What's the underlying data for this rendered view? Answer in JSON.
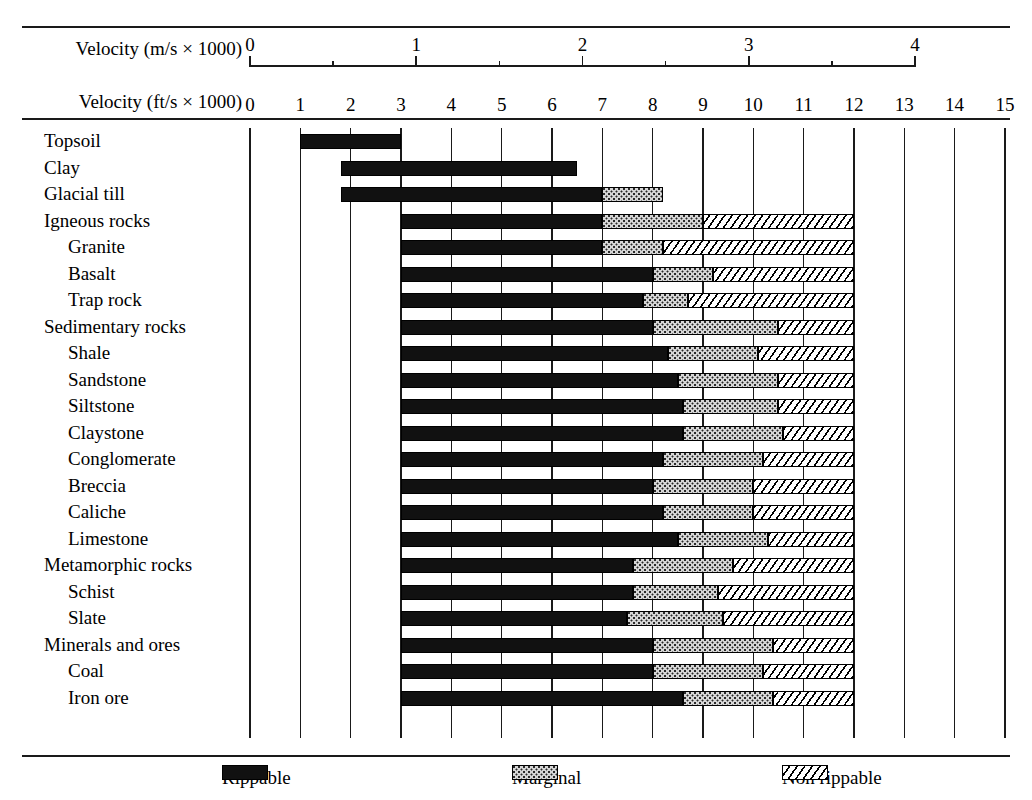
{
  "axes": {
    "metric_caption": "Velocity (m/s × 1000)",
    "imperial_caption": "Velocity (ft/s × 1000)",
    "metric_ticks": [
      "0",
      "1",
      "2",
      "3",
      "4"
    ],
    "imperial_ticks": [
      "0",
      "1",
      "2",
      "3",
      "4",
      "5",
      "6",
      "7",
      "8",
      "9",
      "10",
      "11",
      "12",
      "13",
      "14",
      "15"
    ]
  },
  "legend": {
    "items": [
      {
        "label": "Rippable",
        "pattern": "solid-black"
      },
      {
        "label": "Marginal",
        "pattern": "stippled-gray"
      },
      {
        "label": "Non rippable",
        "pattern": "diagonal-hatch"
      }
    ]
  },
  "chart_data": {
    "type": "bar",
    "title": "",
    "xlabel": "Velocity (ft/s × 1000)",
    "ylabel": "",
    "xlim": [
      0,
      15
    ],
    "secondary_xlim_m_per_s": [
      0,
      4
    ],
    "grid": true,
    "legend_position": "bottom",
    "categories": [
      "Topsoil",
      "Clay",
      "Glacial till",
      "Igneous rocks",
      "Granite",
      "Basalt",
      "Trap rock",
      "Sedimentary rocks",
      "Shale",
      "Sandstone",
      "Siltstone",
      "Claystone",
      "Conglomerate",
      "Breccia",
      "Caliche",
      "Limestone",
      "Metamorphic rocks",
      "Schist",
      "Slate",
      "Minerals and ores",
      "Coal",
      "Iron ore"
    ],
    "rows": [
      {
        "label": "Topsoil",
        "indent": 0,
        "rippable": [
          1.0,
          3.0
        ],
        "marginal": null,
        "nonrippable": null
      },
      {
        "label": "Clay",
        "indent": 0,
        "rippable": [
          1.8,
          6.5
        ],
        "marginal": null,
        "nonrippable": null
      },
      {
        "label": "Glacial till",
        "indent": 0,
        "rippable": [
          1.8,
          7.0
        ],
        "marginal": [
          7.0,
          8.2
        ],
        "nonrippable": null
      },
      {
        "label": "Igneous rocks",
        "indent": 0,
        "rippable": [
          3.0,
          7.0
        ],
        "marginal": [
          7.0,
          9.0
        ],
        "nonrippable": [
          9.0,
          12.0
        ]
      },
      {
        "label": "Granite",
        "indent": 1,
        "rippable": [
          3.0,
          7.0
        ],
        "marginal": [
          7.0,
          8.2
        ],
        "nonrippable": [
          8.2,
          12.0
        ]
      },
      {
        "label": "Basalt",
        "indent": 1,
        "rippable": [
          3.0,
          8.0
        ],
        "marginal": [
          8.0,
          9.2
        ],
        "nonrippable": [
          9.2,
          12.0
        ]
      },
      {
        "label": "Trap rock",
        "indent": 1,
        "rippable": [
          3.0,
          7.8
        ],
        "marginal": [
          7.8,
          8.7
        ],
        "nonrippable": [
          8.7,
          12.0
        ]
      },
      {
        "label": "Sedimentary rocks",
        "indent": 0,
        "rippable": [
          3.0,
          8.0
        ],
        "marginal": [
          8.0,
          10.5
        ],
        "nonrippable": [
          10.5,
          12.0
        ]
      },
      {
        "label": "Shale",
        "indent": 1,
        "rippable": [
          3.0,
          8.3
        ],
        "marginal": [
          8.3,
          10.1
        ],
        "nonrippable": [
          10.1,
          12.0
        ]
      },
      {
        "label": "Sandstone",
        "indent": 1,
        "rippable": [
          3.0,
          8.5
        ],
        "marginal": [
          8.5,
          10.5
        ],
        "nonrippable": [
          10.5,
          12.0
        ]
      },
      {
        "label": "Siltstone",
        "indent": 1,
        "rippable": [
          3.0,
          8.6
        ],
        "marginal": [
          8.6,
          10.5
        ],
        "nonrippable": [
          10.5,
          12.0
        ]
      },
      {
        "label": "Claystone",
        "indent": 1,
        "rippable": [
          3.0,
          8.6
        ],
        "marginal": [
          8.6,
          10.6
        ],
        "nonrippable": [
          10.6,
          12.0
        ]
      },
      {
        "label": "Conglomerate",
        "indent": 1,
        "rippable": [
          3.0,
          8.2
        ],
        "marginal": [
          8.2,
          10.2
        ],
        "nonrippable": [
          10.2,
          12.0
        ]
      },
      {
        "label": "Breccia",
        "indent": 1,
        "rippable": [
          3.0,
          8.0
        ],
        "marginal": [
          8.0,
          10.0
        ],
        "nonrippable": [
          10.0,
          12.0
        ]
      },
      {
        "label": "Caliche",
        "indent": 1,
        "rippable": [
          3.0,
          8.2
        ],
        "marginal": [
          8.2,
          10.0
        ],
        "nonrippable": [
          10.0,
          12.0
        ]
      },
      {
        "label": "Limestone",
        "indent": 1,
        "rippable": [
          3.0,
          8.5
        ],
        "marginal": [
          8.5,
          10.3
        ],
        "nonrippable": [
          10.3,
          12.0
        ]
      },
      {
        "label": "Metamorphic rocks",
        "indent": 0,
        "rippable": [
          3.0,
          7.6
        ],
        "marginal": [
          7.6,
          9.6
        ],
        "nonrippable": [
          9.6,
          12.0
        ]
      },
      {
        "label": "Schist",
        "indent": 1,
        "rippable": [
          3.0,
          7.6
        ],
        "marginal": [
          7.6,
          9.3
        ],
        "nonrippable": [
          9.3,
          12.0
        ]
      },
      {
        "label": "Slate",
        "indent": 1,
        "rippable": [
          3.0,
          7.5
        ],
        "marginal": [
          7.5,
          9.4
        ],
        "nonrippable": [
          9.4,
          12.0
        ]
      },
      {
        "label": "Minerals and ores",
        "indent": 0,
        "rippable": [
          3.0,
          8.0
        ],
        "marginal": [
          8.0,
          10.4
        ],
        "nonrippable": [
          10.4,
          12.0
        ]
      },
      {
        "label": "Coal",
        "indent": 1,
        "rippable": [
          3.0,
          8.0
        ],
        "marginal": [
          8.0,
          10.2
        ],
        "nonrippable": [
          10.2,
          12.0
        ]
      },
      {
        "label": "Iron ore",
        "indent": 1,
        "rippable": [
          3.0,
          8.6
        ],
        "marginal": [
          8.6,
          10.4
        ],
        "nonrippable": [
          10.4,
          12.0
        ]
      }
    ]
  }
}
